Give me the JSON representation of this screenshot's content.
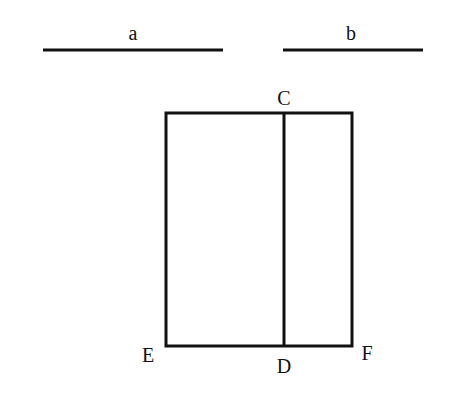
{
  "diagram": {
    "segments": [
      {
        "label": "a",
        "x1": 43,
        "x2": 223,
        "y": 50
      },
      {
        "label": "b",
        "x1": 283,
        "x2": 423,
        "y": 50
      }
    ],
    "rectangle": {
      "left": 166,
      "top": 113,
      "right": 352,
      "bottom": 346
    },
    "divider": {
      "x": 284,
      "top_label": "C",
      "bottom_label": "D"
    },
    "corner_labels": {
      "bottom_left": "E",
      "bottom_right": "F"
    },
    "line_color": "#111111"
  }
}
